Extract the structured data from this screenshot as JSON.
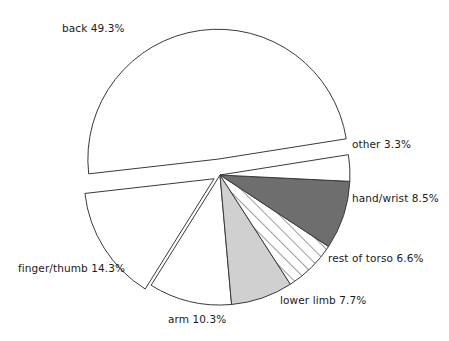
{
  "chart_data": {
    "type": "pie",
    "title": "",
    "subtitle": "",
    "xlabel": "",
    "ylabel": "",
    "legend_position": "none",
    "grid": false,
    "labels_inline": true,
    "total_percent": 100.0,
    "categories": [
      "back",
      "finger/thumb",
      "arm",
      "lower limb",
      "rest of torso",
      "hand/wrist",
      "other"
    ],
    "values": [
      49.3,
      14.3,
      10.3,
      7.7,
      6.6,
      8.5,
      3.3
    ],
    "slices": [
      {
        "name": "back",
        "value": 49.3,
        "label": "back 49.3%",
        "fill": "#ffffff",
        "pattern": "none",
        "exploded": true,
        "start_deg": 9.0,
        "end_deg": 186.5
      },
      {
        "name": "finger/thumb",
        "value": 14.3,
        "label": "finger/thumb 14.3%",
        "fill": "#ffffff",
        "pattern": "none",
        "exploded": true,
        "start_deg": 186.5,
        "end_deg": 238.0
      },
      {
        "name": "arm",
        "value": 10.3,
        "label": "arm 10.3%",
        "fill": "#ffffff",
        "pattern": "none",
        "exploded": false,
        "start_deg": 238.0,
        "end_deg": 275.1
      },
      {
        "name": "lower limb",
        "value": 7.7,
        "label": "lower limb 7.7%",
        "fill": "#d0d0d0",
        "pattern": "none",
        "exploded": false,
        "start_deg": 275.1,
        "end_deg": 302.8
      },
      {
        "name": "rest of torso",
        "value": 6.6,
        "label": "rest of torso 6.6%",
        "fill": "#ffffff",
        "pattern": "diagonal-hatch",
        "exploded": false,
        "start_deg": 302.8,
        "end_deg": 326.6
      },
      {
        "name": "hand/wrist",
        "value": 8.5,
        "label": "hand/wrist 8.5%",
        "fill": "#6e6e6e",
        "pattern": "none",
        "exploded": false,
        "start_deg": 326.6,
        "end_deg": 357.2
      },
      {
        "name": "other",
        "value": 3.3,
        "label": "other 3.3%",
        "fill": "#ffffff",
        "pattern": "none",
        "exploded": false,
        "start_deg": 357.2,
        "end_deg": 369.0
      }
    ],
    "colors": {
      "outline": "#3a3a3a",
      "white": "#ffffff",
      "dark_gray": "#6e6e6e",
      "light_gray": "#d0d0d0",
      "background": "#ffffff",
      "text": "#1a1a1a"
    },
    "geometry": {
      "center_x": 220,
      "center_y": 175,
      "radius": 130,
      "explode_back_offset": 16,
      "explode_finger_offset": 7
    }
  }
}
